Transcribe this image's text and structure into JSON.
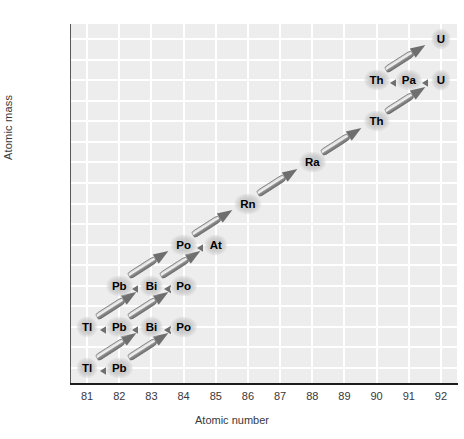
{
  "chart_data": {
    "type": "scatter",
    "title": "",
    "xlabel": "Atomic number",
    "ylabel": "Atomic mass",
    "xlim": [
      80.5,
      92.5
    ],
    "ylim": [
      204.5,
      239.5
    ],
    "xticks": [
      81,
      82,
      83,
      84,
      85,
      86,
      87,
      88,
      89,
      90,
      91,
      92
    ],
    "yticks": [
      206,
      210,
      214,
      218,
      222,
      226,
      230,
      234,
      238
    ],
    "grid": true,
    "legend": "none",
    "nodes": [
      {
        "label": "U",
        "z": 92,
        "mass": 238
      },
      {
        "label": "Th",
        "z": 90,
        "mass": 234
      },
      {
        "label": "Pa",
        "z": 91,
        "mass": 234
      },
      {
        "label": "U",
        "z": 92,
        "mass": 234
      },
      {
        "label": "Th",
        "z": 90,
        "mass": 230
      },
      {
        "label": "Ra",
        "z": 88,
        "mass": 226
      },
      {
        "label": "Rn",
        "z": 86,
        "mass": 222
      },
      {
        "label": "Po",
        "z": 84,
        "mass": 218
      },
      {
        "label": "At",
        "z": 85,
        "mass": 218
      },
      {
        "label": "Pb",
        "z": 82,
        "mass": 214
      },
      {
        "label": "Bi",
        "z": 83,
        "mass": 214
      },
      {
        "label": "Po",
        "z": 84,
        "mass": 214
      },
      {
        "label": "Tl",
        "z": 81,
        "mass": 210
      },
      {
        "label": "Pb",
        "z": 82,
        "mass": 210
      },
      {
        "label": "Bi",
        "z": 83,
        "mass": 210
      },
      {
        "label": "Po",
        "z": 84,
        "mass": 210
      },
      {
        "label": "Tl",
        "z": 81,
        "mass": 206
      },
      {
        "label": "Pb",
        "z": 82,
        "mass": 206
      }
    ],
    "alpha_decays": [
      {
        "from_z": 92,
        "from_mass": 238,
        "to_z": 90,
        "to_mass": 234
      },
      {
        "from_z": 92,
        "from_mass": 234,
        "to_z": 90,
        "to_mass": 230
      },
      {
        "from_z": 90,
        "from_mass": 230,
        "to_z": 88,
        "to_mass": 226
      },
      {
        "from_z": 88,
        "from_mass": 226,
        "to_z": 86,
        "to_mass": 222
      },
      {
        "from_z": 86,
        "from_mass": 222,
        "to_z": 84,
        "to_mass": 218
      },
      {
        "from_z": 84,
        "from_mass": 218,
        "to_z": 82,
        "to_mass": 214
      },
      {
        "from_z": 85,
        "from_mass": 218,
        "to_z": 83,
        "to_mass": 214
      },
      {
        "from_z": 83,
        "from_mass": 214,
        "to_z": 81,
        "to_mass": 210
      },
      {
        "from_z": 84,
        "from_mass": 214,
        "to_z": 82,
        "to_mass": 210
      },
      {
        "from_z": 83,
        "from_mass": 210,
        "to_z": 81,
        "to_mass": 206
      },
      {
        "from_z": 84,
        "from_mass": 210,
        "to_z": 82,
        "to_mass": 206
      }
    ],
    "beta_decays": [
      {
        "from_z": 91,
        "from_mass": 234,
        "to_z": 90,
        "to_mass": 234
      },
      {
        "from_z": 92,
        "from_mass": 234,
        "to_z": 91,
        "to_mass": 234
      },
      {
        "from_z": 85,
        "from_mass": 218,
        "to_z": 84,
        "to_mass": 218
      },
      {
        "from_z": 83,
        "from_mass": 214,
        "to_z": 82,
        "to_mass": 214
      },
      {
        "from_z": 84,
        "from_mass": 214,
        "to_z": 83,
        "to_mass": 214
      },
      {
        "from_z": 82,
        "from_mass": 210,
        "to_z": 81,
        "to_mass": 210
      },
      {
        "from_z": 83,
        "from_mass": 210,
        "to_z": 82,
        "to_mass": 210
      },
      {
        "from_z": 84,
        "from_mass": 210,
        "to_z": 83,
        "to_mass": 210
      },
      {
        "from_z": 82,
        "from_mass": 206,
        "to_z": 81,
        "to_mass": 206
      }
    ]
  },
  "style": {
    "plot_background": "#ededed",
    "gridline_color": "#ffffff",
    "axis_color": "#1d1d1b",
    "tick_text_color": "#39383a",
    "arrow_dark": "#6e6e6e",
    "arrow_light": "#f4f4f4",
    "label_text_color": "#000000"
  }
}
